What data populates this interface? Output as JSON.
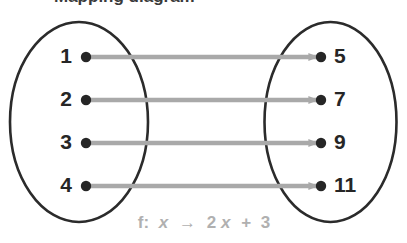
{
  "diagram": {
    "type": "mapping-diagram",
    "title_cut_off": "Mapping diagram",
    "domain_set": {
      "name": "domain-oval",
      "elements": [
        {
          "label": "1",
          "x": 72,
          "y": 57
        },
        {
          "label": "2",
          "x": 72,
          "y": 100
        },
        {
          "label": "3",
          "x": 72,
          "y": 143
        },
        {
          "label": "4",
          "x": 72,
          "y": 186
        }
      ]
    },
    "range_set": {
      "name": "range-oval",
      "elements": [
        {
          "label": "5",
          "x": 330,
          "y": 57
        },
        {
          "label": "7",
          "x": 330,
          "y": 100
        },
        {
          "label": "9",
          "x": 330,
          "y": 143
        },
        {
          "label": "11",
          "x": 330,
          "y": 186
        }
      ]
    },
    "arrows": [
      {
        "from": "1",
        "to": "5",
        "y": 57
      },
      {
        "from": "2",
        "to": "7",
        "y": 100
      },
      {
        "from": "3",
        "to": "9",
        "y": 143
      },
      {
        "from": "4",
        "to": "11",
        "y": 186
      }
    ],
    "rule": {
      "prefix": "f:",
      "variable": "x",
      "maps_to": "→",
      "expression_coefficient": "2",
      "expression_variable": "x",
      "expression_plus": "+",
      "expression_constant": "3",
      "full_text": "f: x → 2x + 3"
    },
    "colors": {
      "oval_stroke": "#2b2b2b",
      "dot_fill": "#262626",
      "arrow": "#a9a9a9",
      "label_text": "#262626",
      "rule_text": "#b0b0b0",
      "background": "#ffffff"
    }
  }
}
